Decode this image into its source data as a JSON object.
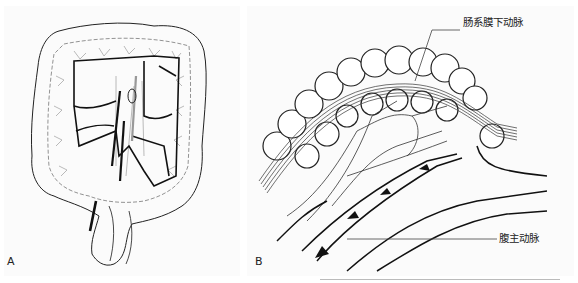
{
  "figure": {
    "panels": [
      {
        "letter": "A",
        "description": "Colon frame with mesenteric vascular arcades (line drawing)"
      },
      {
        "letter": "B",
        "description": "Sigmoid colon with mesentery, inferior mesenteric artery branches and abdominal aorta with flow arrows"
      }
    ],
    "labels": {
      "inferior_mesenteric_artery": "肠系膜下动脉",
      "abdominal_aorta": "腹主动脉"
    },
    "colors": {
      "line": "#1a1a1a",
      "vessel_gray": "#9a9a9a",
      "background": "#fbfbfb"
    }
  }
}
